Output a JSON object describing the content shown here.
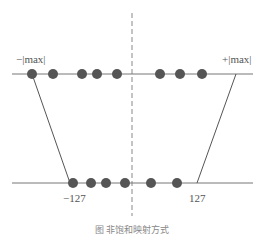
{
  "diagram": {
    "type": "int8-quantization-mapping",
    "colors": {
      "line": "#777777",
      "dot": "#555555",
      "dashed_axis": "#888888",
      "label": "#555555"
    },
    "top_axis": {
      "left_label": "−|max|",
      "right_label": "+|max|",
      "dot_count": 8
    },
    "bottom_axis": {
      "left_label": "−127",
      "right_label": "127",
      "dot_count": 6
    },
    "caption": "图 非饱和映射方式"
  }
}
